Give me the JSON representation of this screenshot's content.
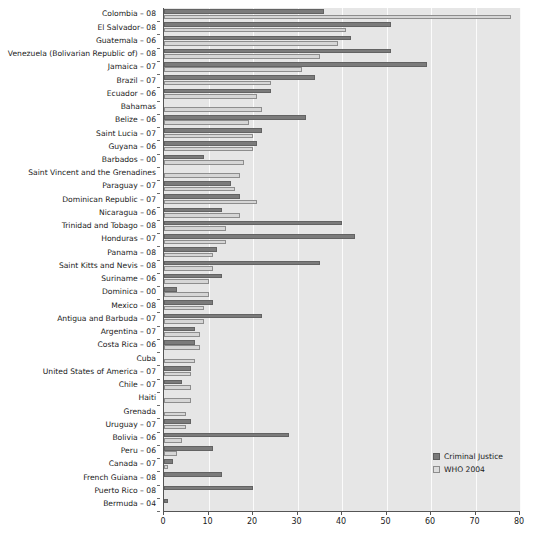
{
  "chart_data": {
    "type": "bar",
    "orientation": "horizontal",
    "title": "",
    "xlabel": "",
    "ylabel": "",
    "xlim": [
      0,
      80
    ],
    "xticks": [
      0,
      10,
      20,
      30,
      40,
      50,
      60,
      70,
      80
    ],
    "grid": true,
    "legend_position": "bottom-right",
    "legend": [
      "Criminal Justice",
      "WHO 2004"
    ],
    "colors": {
      "criminal_justice": "#7b7b7b",
      "who_2004": "#d6d6d6",
      "plot_background": "#e6e6e6",
      "gridline": "#fbfbfb",
      "axis": "#555555",
      "text": "#1a1a1a"
    },
    "categories": [
      "Colombia – 08",
      "El Salvador– 08",
      "Guatemala – 06",
      "Venezuela (Bolivarian Republic of) – 08",
      "Jamaica – 07",
      "Brazil – 07",
      "Ecuador – 06",
      "Bahamas",
      "Belize – 06",
      "Saint Lucia – 07",
      "Guyana – 06",
      "Barbados – 00",
      "Saint Vincent and the Grenadines",
      "Paraguay – 07",
      "Dominican Republic – 07",
      "Nicaragua – 06",
      "Trinidad and Tobago – 08",
      "Honduras – 07",
      "Panama – 08",
      "Saint Kitts and Nevis – 08",
      "Suriname – 06",
      "Dominica – 00",
      "Mexico – 08",
      "Antigua and Barbuda – 07",
      "Argentina – 07",
      "Costa Rica – 06",
      "Cuba",
      "United States of America – 07",
      "Chile – 07",
      "Haiti",
      "Grenada",
      "Uruguay – 07",
      "Bolivia – 06",
      "Peru – 06",
      "Canada – 07",
      "French Guiana – 08",
      "Puerto Rico – 08",
      "Bermuda – 04"
    ],
    "series": [
      {
        "name": "Criminal Justice",
        "values": [
          36,
          51,
          42,
          51,
          59,
          34,
          24,
          0,
          32,
          22,
          21,
          9,
          0,
          15,
          17,
          13,
          40,
          43,
          12,
          35,
          13,
          3,
          11,
          22,
          7,
          7,
          0,
          6,
          4,
          0,
          0,
          6,
          28,
          11,
          2,
          13,
          20,
          1
        ]
      },
      {
        "name": "WHO 2004",
        "values": [
          78,
          41,
          39,
          35,
          31,
          24,
          21,
          22,
          19,
          20,
          20,
          18,
          17,
          16,
          21,
          17,
          14,
          14,
          11,
          11,
          10,
          10,
          9,
          9,
          8,
          8,
          7,
          6,
          6,
          6,
          5,
          5,
          4,
          3,
          1,
          0,
          0,
          0
        ]
      }
    ]
  }
}
